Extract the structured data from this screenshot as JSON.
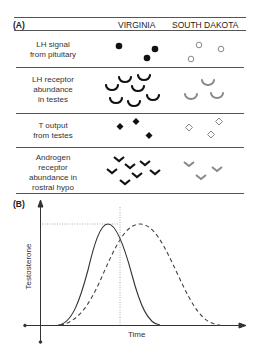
{
  "panel_a": {
    "tag": "(A)",
    "columns": [
      "VIRGINIA",
      "SOUTH DAKOTA"
    ],
    "rows": [
      {
        "label_lines": [
          "LH signal",
          "from pituitary"
        ],
        "symbol": "circle",
        "virginia_count": 3,
        "south_dakota_count": 3
      },
      {
        "label_lines": [
          "LH receptor",
          "abundance",
          "in testes"
        ],
        "symbol": "cup",
        "virginia_count": 7,
        "south_dakota_count": 3
      },
      {
        "label_lines": [
          "T output",
          "from testes"
        ],
        "symbol": "diamond",
        "virginia_count": 3,
        "south_dakota_count": 3
      },
      {
        "label_lines": [
          "Androgen",
          "receptor",
          "abundance in",
          "rostral hypo"
        ],
        "symbol": "chevron",
        "virginia_count": 7,
        "south_dakota_count": 3
      }
    ],
    "colors": {
      "virginia": "#111111",
      "south_dakota": "#888888"
    }
  },
  "panel_b": {
    "tag": "(B)",
    "ylabel": "Testosterone",
    "xlabel": "Time",
    "series": [
      {
        "name": "Virginia",
        "style": "solid",
        "peak_time": 0.35,
        "peak_value": 1.0
      },
      {
        "name": "South Dakota",
        "style": "dashed",
        "peak_time": 0.5,
        "peak_value": 1.0
      }
    ]
  }
}
